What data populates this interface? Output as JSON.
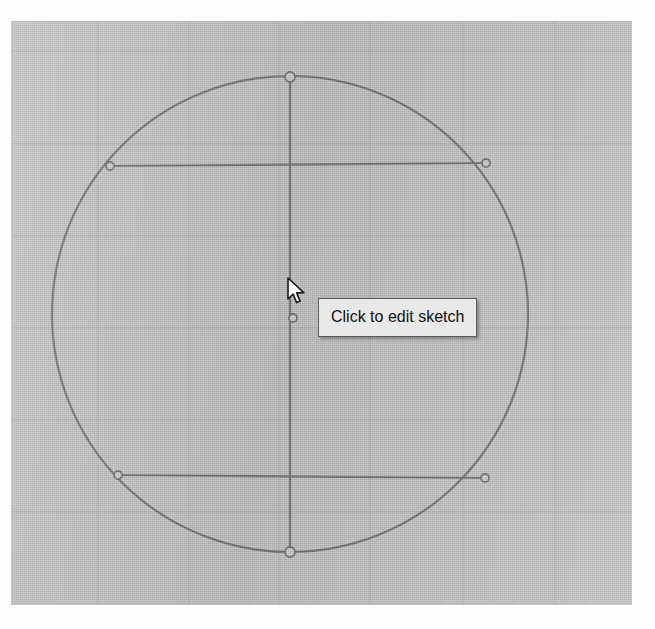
{
  "app": {
    "surface_name": "cad-sketch-viewport",
    "background_color": "#bdbdbd",
    "canvas": {
      "left": 11,
      "top": 21,
      "width": 621,
      "height": 584
    }
  },
  "tooltip": {
    "text": "Click to edit sketch",
    "background_color": "#e9e9e9",
    "border_color": "#5d5d5d",
    "text_color": "#101010",
    "x": 318,
    "y": 298,
    "width": 169,
    "height": 40
  },
  "cursor": {
    "kind": "arrow-pointer",
    "x": 286,
    "y": 277
  },
  "grid": {
    "visible": true,
    "line_color": "#a8a8a8",
    "vertical_x": [
      98,
      189,
      279,
      370,
      463,
      555
    ],
    "horizontal_y": [
      51,
      144,
      236,
      328,
      420,
      512,
      584
    ]
  },
  "sketch": {
    "geometry_color": "#6d6d6d",
    "handle_fill": "#c8c8c8",
    "handle_stroke": "#6d6d6d",
    "circle": {
      "name": "construction-circle",
      "center_x": 290,
      "center_y": 314,
      "radius": 238
    },
    "lines": [
      {
        "name": "vertical-diameter-line",
        "x1": 290,
        "y1": 77,
        "x2": 290,
        "y2": 552
      },
      {
        "name": "upper-horizontal-chord",
        "x1": 110,
        "y1": 166,
        "x2": 486,
        "y2": 163
      },
      {
        "name": "lower-horizontal-chord",
        "x1": 118,
        "y1": 475,
        "x2": 485,
        "y2": 478
      }
    ],
    "points": [
      {
        "name": "point-top",
        "x": 290,
        "y": 77,
        "r": 5
      },
      {
        "name": "point-bottom",
        "x": 290,
        "y": 552,
        "r": 5
      },
      {
        "name": "point-center",
        "x": 293,
        "y": 318,
        "r": 4
      },
      {
        "name": "point-upper-left",
        "x": 110,
        "y": 166,
        "r": 4
      },
      {
        "name": "point-upper-right",
        "x": 486,
        "y": 163,
        "r": 4
      },
      {
        "name": "point-lower-left",
        "x": 118,
        "y": 475,
        "r": 4
      },
      {
        "name": "point-lower-right",
        "x": 485,
        "y": 478,
        "r": 4
      }
    ]
  }
}
